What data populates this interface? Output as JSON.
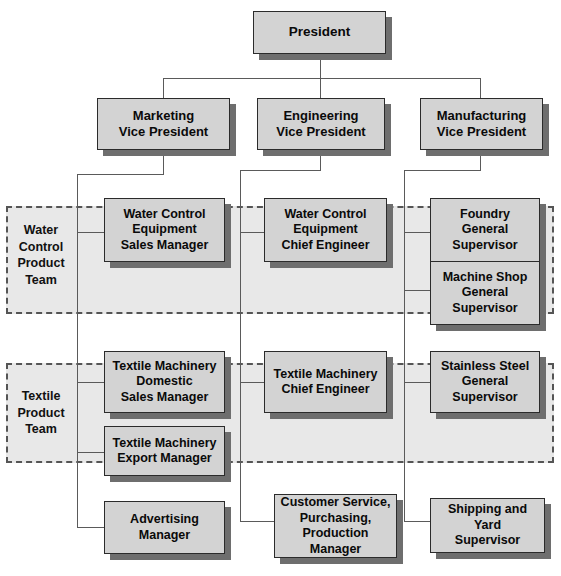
{
  "diagram": {
    "background_color": "#ffffff",
    "box_fill_color": "#d3d3d3",
    "box_border_color": "#2b2b2b",
    "box_shadow_color": "#6e6e6e",
    "connector_color": "#5a5a5a",
    "team_region_fill": "#e8e8e8",
    "team_region_border": "#555555"
  },
  "nodes": {
    "president": "President",
    "marketing_vp": "Marketing\nVice President",
    "engineering_vp": "Engineering\nVice President",
    "manufacturing_vp": "Manufacturing\nVice President",
    "water_sales_manager": "Water Control\nEquipment\nSales Manager",
    "water_chief_engineer": "Water Control\nEquipment\nChief Engineer",
    "foundry_supervisor": "Foundry\nGeneral\nSupervisor",
    "machine_shop_supervisor": "Machine Shop\nGeneral\nSupervisor",
    "textile_domestic_sales_manager": "Textile Machinery\nDomestic\nSales Manager",
    "textile_chief_engineer": "Textile Machinery\nChief Engineer",
    "stainless_steel_supervisor": "Stainless Steel\nGeneral\nSupervisor",
    "textile_export_manager": "Textile Machinery\nExport Manager",
    "advertising_manager": "Advertising\nManager",
    "customer_service_manager": "Customer Service,\nPurchasing,\nProduction Manager",
    "shipping_yard_supervisor": "Shipping and Yard\nSupervisor"
  },
  "teams": {
    "water_control": "Water\nControl\nProduct\nTeam",
    "textile": "Textile\nProduct\nTeam"
  }
}
